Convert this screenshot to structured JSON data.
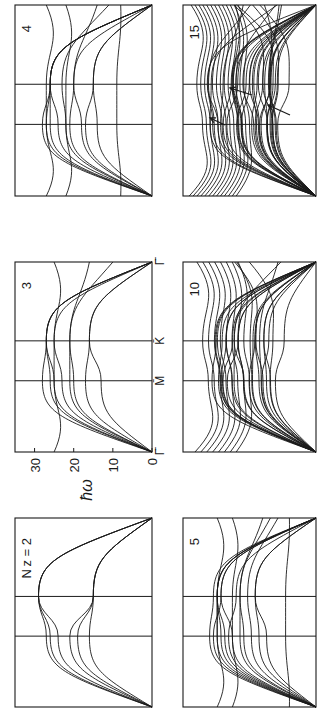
{
  "figure": {
    "orientation": "rotated 90 degrees counter-clockwise",
    "y_axis_label": "ħω",
    "y_ticks": [
      "0",
      "10",
      "20",
      "30"
    ],
    "x_ticks": [
      "Γ̄",
      "M̄",
      "K̄",
      "Γ̄"
    ],
    "ink_color": "#1a1a1a",
    "background": "#ffffff"
  },
  "chart_data": [
    {
      "type": "line",
      "title": "N_z = 2",
      "panel_label": "N_z = 2",
      "layers": 2,
      "x": [
        "Γ̄",
        "M̄",
        "K̄",
        "Γ̄"
      ],
      "xlabel": "",
      "ylabel": "ħω",
      "ylim": [
        0,
        35
      ],
      "grid": false,
      "series_count": 6,
      "series": [
        {
          "name": "branch 1",
          "values": [
            0,
            16,
            15,
            0
          ]
        },
        {
          "name": "branch 2",
          "values": [
            0,
            19,
            15,
            0
          ]
        },
        {
          "name": "branch 3",
          "values": [
            0,
            26,
            29,
            0
          ]
        },
        {
          "name": "branch 4",
          "values": [
            0,
            27,
            29,
            0
          ]
        },
        {
          "name": "branch 5",
          "values": [
            0,
            24,
            29,
            0
          ]
        },
        {
          "name": "branch 6",
          "values": [
            0,
            21,
            15,
            0
          ]
        }
      ]
    },
    {
      "type": "line",
      "title": "3",
      "panel_label": "3",
      "layers": 3,
      "x": [
        "Γ̄",
        "M̄",
        "K̄",
        "Γ̄"
      ],
      "xlabel": "",
      "ylabel": "ħω",
      "ylim": [
        0,
        35
      ],
      "grid": false,
      "series_count": 9,
      "series": [
        {
          "name": "branch 1",
          "values": [
            0,
            13,
            16,
            0
          ]
        },
        {
          "name": "branch 2",
          "values": [
            0,
            17,
            16,
            0
          ]
        },
        {
          "name": "branch 3",
          "values": [
            0,
            20,
            21,
            10
          ]
        },
        {
          "name": "branch 4",
          "values": [
            0,
            21,
            21,
            16
          ]
        },
        {
          "name": "branch 5",
          "values": [
            0,
            25,
            27,
            0
          ]
        },
        {
          "name": "branch 6",
          "values": [
            0,
            26,
            27,
            0
          ]
        },
        {
          "name": "branch 7",
          "values": [
            0,
            28,
            27,
            0
          ]
        },
        {
          "name": "branch 8",
          "values": [
            0,
            23,
            25,
            0
          ]
        },
        {
          "name": "branch 9",
          "values": [
            25,
            25,
            25,
            25
          ]
        }
      ]
    },
    {
      "type": "line",
      "title": "4",
      "panel_label": "4",
      "layers": 4,
      "x": [
        "Γ̄",
        "M̄",
        "K̄",
        "Γ̄"
      ],
      "xlabel": "",
      "ylabel": "ħω",
      "ylim": [
        0,
        35
      ],
      "grid": false,
      "series_count": 12,
      "series": [
        {
          "name": "branch 1",
          "values": [
            8,
            9,
            9,
            8
          ]
        },
        {
          "name": "branch 2",
          "values": [
            0,
            14,
            15,
            0
          ]
        },
        {
          "name": "branch 3",
          "values": [
            0,
            17,
            15,
            0
          ]
        },
        {
          "name": "branch 4",
          "values": [
            0,
            18,
            20,
            14
          ]
        },
        {
          "name": "branch 5",
          "values": [
            0,
            21,
            20,
            0
          ]
        },
        {
          "name": "branch 6",
          "values": [
            0,
            22,
            23,
            11
          ]
        },
        {
          "name": "branch 7",
          "values": [
            0,
            24,
            26,
            0
          ]
        },
        {
          "name": "branch 8",
          "values": [
            0,
            26,
            26,
            0
          ]
        },
        {
          "name": "branch 9",
          "values": [
            0,
            28,
            26,
            0
          ]
        },
        {
          "name": "branch 10",
          "values": [
            0,
            27,
            26,
            0
          ]
        },
        {
          "name": "branch 11",
          "values": [
            22,
            22,
            22,
            22
          ]
        },
        {
          "name": "branch 12",
          "values": [
            27,
            27,
            27,
            27
          ]
        }
      ]
    },
    {
      "type": "line",
      "title": "5",
      "panel_label": "5",
      "layers": 5,
      "x": [
        "Γ̄",
        "M̄",
        "K̄",
        "Γ̄"
      ],
      "xlabel": "",
      "ylabel": "ħω",
      "ylim": [
        0,
        35
      ],
      "grid": false,
      "series_count": 15,
      "series": [
        {
          "name": "branch 1",
          "values": [
            7,
            8,
            8,
            7
          ]
        },
        {
          "name": "branch 2",
          "values": [
            0,
            13,
            16,
            0
          ]
        },
        {
          "name": "branch 3",
          "values": [
            0,
            15,
            16,
            0
          ]
        },
        {
          "name": "branch 4",
          "values": [
            0,
            17,
            18,
            10
          ]
        },
        {
          "name": "branch 5",
          "values": [
            0,
            19,
            20,
            12
          ]
        },
        {
          "name": "branch 6",
          "values": [
            0,
            20,
            20,
            14
          ]
        },
        {
          "name": "branch 7",
          "values": [
            0,
            22,
            25,
            0
          ]
        },
        {
          "name": "branch 8",
          "values": [
            0,
            24,
            26,
            0
          ]
        },
        {
          "name": "branch 9",
          "values": [
            0,
            25,
            26,
            0
          ]
        },
        {
          "name": "branch 10",
          "values": [
            0,
            26,
            26,
            0
          ]
        },
        {
          "name": "branch 11",
          "values": [
            0,
            28,
            27,
            0
          ]
        },
        {
          "name": "branch 12",
          "values": [
            0,
            27,
            25,
            0
          ]
        },
        {
          "name": "branch 13",
          "values": [
            22,
            22,
            22,
            22
          ]
        },
        {
          "name": "branch 14",
          "values": [
            26,
            26,
            26,
            26
          ]
        },
        {
          "name": "branch 15",
          "values": [
            0,
            23,
            21,
            0
          ]
        }
      ]
    },
    {
      "type": "line",
      "title": "10",
      "panel_label": "10",
      "layers": 10,
      "x": [
        "Γ̄",
        "M̄",
        "K̄",
        "Γ̄"
      ],
      "xlabel": "",
      "ylabel": "ħω",
      "ylim": [
        0,
        35
      ],
      "grid": false,
      "series_count": 30,
      "description": "dense band of ~30 branches; flat branches near 24–32 at Γ̄, surface-mode band between 12 and 28"
    },
    {
      "type": "line",
      "title": "15",
      "panel_label": "15",
      "layers": 15,
      "x": [
        "Γ̄",
        "M̄",
        "K̄",
        "Γ̄"
      ],
      "xlabel": "",
      "ylabel": "ħω",
      "ylim": [
        0,
        35
      ],
      "grid": false,
      "series_count": 45,
      "annotations": [
        "arrow pointing to upper surface band near M̄",
        "arrow pointing to surface mode near K̄",
        "arrow pointing to lowest surface (Rayleigh-like) mode between M̄ and K̄"
      ],
      "description": "very dense band of ~45 branches; three arrows mark surface modes"
    }
  ]
}
